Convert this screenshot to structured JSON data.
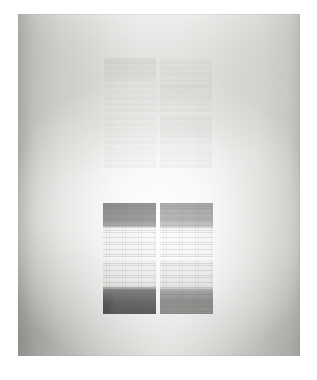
{
  "artwork": {
    "kind": "abstract-minimalist-grid-painting",
    "orientation": "portrait",
    "medium_appearance": "graphite and wash on canvas",
    "caption": "",
    "background_color": "#ffffff",
    "panel": {
      "base_color": "#d8d8d5",
      "highlight_color": "#ffffff",
      "edge_shadow_color": "#787876",
      "left": 18,
      "top": 14,
      "width": 282,
      "height": 342
    },
    "blocks": [
      {
        "id": "upper",
        "label": "Upper faint grid block",
        "rows": 2,
        "columns": 2,
        "tone": "very faint graphite",
        "opacity": "0.26",
        "cells": [
          {
            "id": "u-tl",
            "label": "upper-left quadrant",
            "band": "dark top band, pale lower band",
            "tone_hex": "#96968f"
          },
          {
            "id": "u-tr",
            "label": "upper-right quadrant",
            "band": "mid band across centre",
            "tone_hex": "#a0a09a"
          },
          {
            "id": "u-bl",
            "label": "lower-left quadrant",
            "band": "even pale wash",
            "tone_hex": "#b4b4ae"
          },
          {
            "id": "u-br",
            "label": "lower-right quadrant",
            "band": "dark upper band fading down",
            "tone_hex": "#a5a59f"
          }
        ]
      },
      {
        "id": "lower",
        "label": "Lower dark grid block",
        "rows": 2,
        "columns": 2,
        "tone": "dense graphite banding",
        "opacity": "0.92",
        "cells": [
          {
            "id": "l-tl",
            "label": "upper-left quadrant",
            "band": "dark upper band, pale lower band",
            "tone_hex": "#60605e"
          },
          {
            "id": "l-tr",
            "label": "upper-right quadrant",
            "band": "dark upper band, pale lower band",
            "tone_hex": "#70706e"
          },
          {
            "id": "l-bl",
            "label": "lower-left quadrant",
            "band": "pale upper band, darkest lower band",
            "tone_hex": "#3e3e3c"
          },
          {
            "id": "l-br",
            "label": "lower-right quadrant",
            "band": "pale upper band, dark lower band",
            "tone_hex": "#646462"
          }
        ]
      }
    ]
  }
}
